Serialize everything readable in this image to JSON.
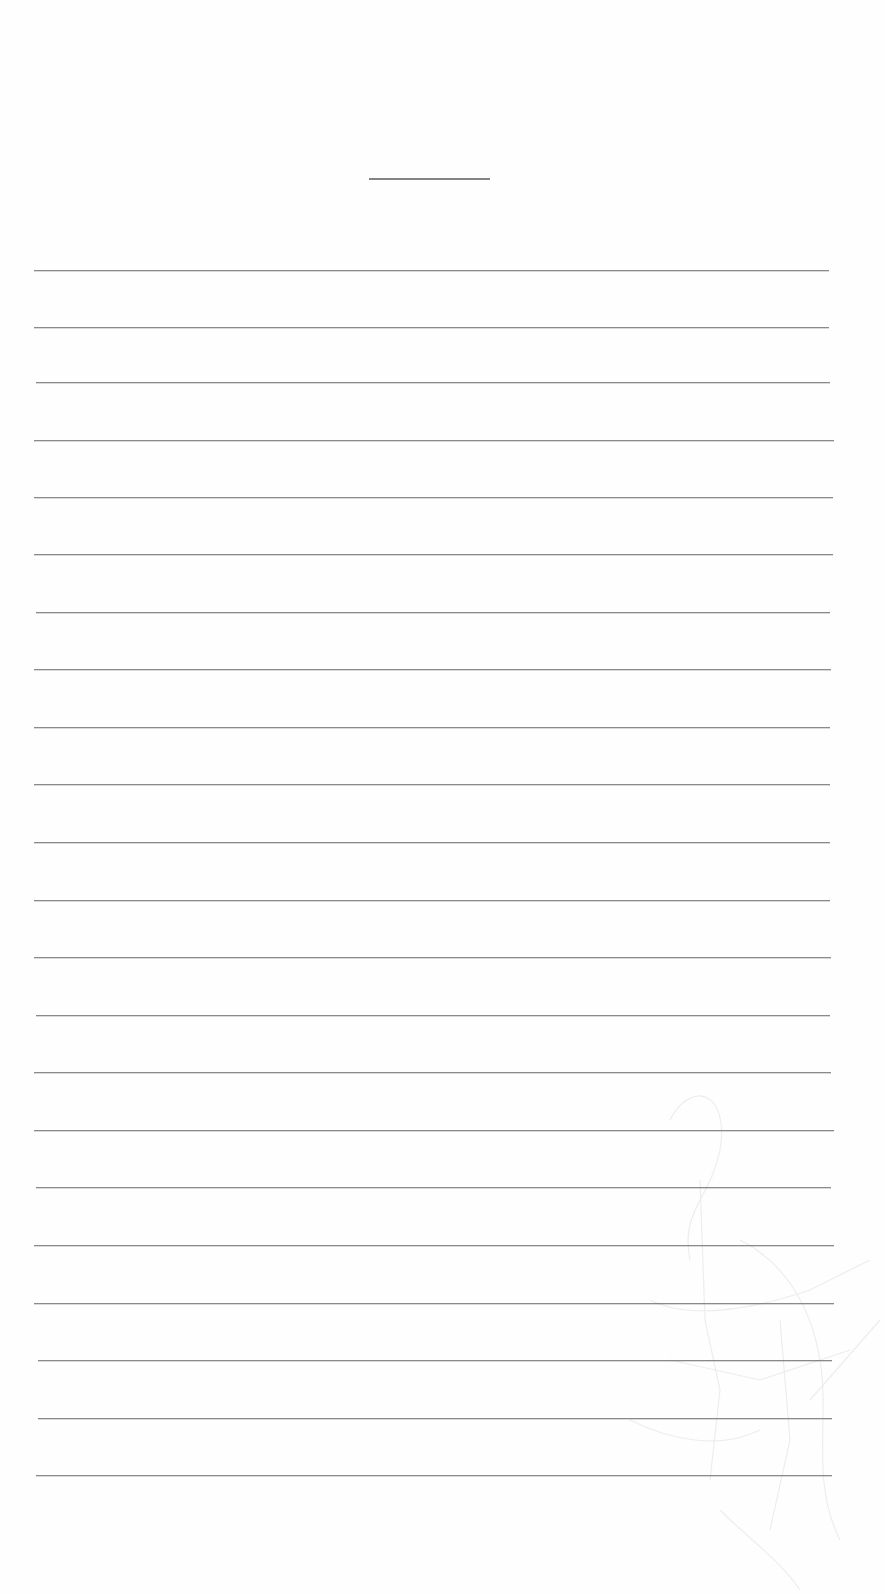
{
  "document": {
    "type": "ruled writing sheet",
    "title_line": {
      "x": 369,
      "y": 178,
      "width": 121
    },
    "ruled_lines": [
      {
        "y": 270,
        "x1": 34,
        "x2": 829
      },
      {
        "y": 327,
        "x1": 34,
        "x2": 829
      },
      {
        "y": 382,
        "x1": 36,
        "x2": 830
      },
      {
        "y": 440,
        "x1": 34,
        "x2": 834
      },
      {
        "y": 497,
        "x1": 34,
        "x2": 833
      },
      {
        "y": 554,
        "x1": 34,
        "x2": 833
      },
      {
        "y": 612,
        "x1": 36,
        "x2": 830
      },
      {
        "y": 669,
        "x1": 34,
        "x2": 831
      },
      {
        "y": 727,
        "x1": 34,
        "x2": 830
      },
      {
        "y": 784,
        "x1": 34,
        "x2": 830
      },
      {
        "y": 842,
        "x1": 34,
        "x2": 830
      },
      {
        "y": 900,
        "x1": 34,
        "x2": 830
      },
      {
        "y": 957,
        "x1": 34,
        "x2": 831
      },
      {
        "y": 1015,
        "x1": 36,
        "x2": 830
      },
      {
        "y": 1072,
        "x1": 34,
        "x2": 831
      },
      {
        "y": 1130,
        "x1": 34,
        "x2": 834
      },
      {
        "y": 1187,
        "x1": 36,
        "x2": 831
      },
      {
        "y": 1245,
        "x1": 34,
        "x2": 834
      },
      {
        "y": 1303,
        "x1": 34,
        "x2": 834
      },
      {
        "y": 1360,
        "x1": 38,
        "x2": 832
      },
      {
        "y": 1418,
        "x1": 38,
        "x2": 832
      },
      {
        "y": 1475,
        "x1": 36,
        "x2": 832
      }
    ],
    "colors": {
      "paper": "#fefefe",
      "line": "#8a8a8a",
      "title_line": "#6e6e6e"
    }
  }
}
